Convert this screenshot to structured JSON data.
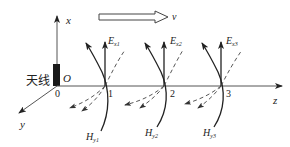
{
  "diagram": {
    "axes": {
      "x_label": "x",
      "y_label": "y",
      "z_label": "z",
      "origin_label": "O",
      "origin_tick": "0"
    },
    "antenna_label": "天线",
    "velocity_label": "v",
    "points": [
      {
        "tick": "1",
        "E_label": "E",
        "E_sub": "x1",
        "H_label": "H",
        "H_sub": "y1"
      },
      {
        "tick": "2",
        "E_label": "E",
        "E_sub": "x2",
        "H_label": "H",
        "H_sub": "y2"
      },
      {
        "tick": "3",
        "E_label": "E",
        "E_sub": "x3",
        "H_label": "H",
        "H_sub": "y3"
      }
    ],
    "colors": {
      "ink": "#222222",
      "axis": "#555555",
      "background": "#ffffff"
    }
  }
}
